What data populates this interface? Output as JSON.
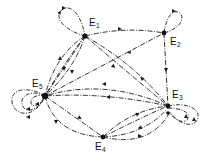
{
  "diagram": {
    "type": "directed-state-transition-graph",
    "nodes": [
      {
        "id": "E1",
        "letter": "E",
        "sub": "1",
        "x": 85,
        "y": 36,
        "lx": 89,
        "ly": 26
      },
      {
        "id": "E2",
        "letter": "E",
        "sub": "2",
        "x": 164,
        "y": 33,
        "lx": 170,
        "ly": 45
      },
      {
        "id": "E3",
        "letter": "E",
        "sub": "3",
        "x": 168,
        "y": 106,
        "lx": 172,
        "ly": 98
      },
      {
        "id": "E4",
        "letter": "E",
        "sub": "4",
        "x": 103,
        "y": 137,
        "lx": 95,
        "ly": 150
      },
      {
        "id": "E5",
        "letter": "E",
        "sub": "5",
        "x": 45,
        "y": 96,
        "lx": 32,
        "ly": 87
      }
    ],
    "edges": [
      {
        "from": "E1",
        "to": "E2"
      },
      {
        "from": "E5",
        "to": "E2"
      },
      {
        "from": "E2",
        "to": "E3"
      },
      {
        "from": "E1",
        "to": "E3"
      },
      {
        "from": "E3",
        "to": "E1"
      },
      {
        "from": "E1",
        "to": "E5"
      },
      {
        "from": "E5",
        "to": "E1"
      },
      {
        "from": "E3",
        "to": "E5"
      },
      {
        "from": "E5",
        "to": "E4"
      },
      {
        "from": "E4",
        "to": "E5"
      },
      {
        "from": "E4",
        "to": "E3"
      },
      {
        "from": "E3",
        "to": "E4"
      }
    ],
    "self_loops": [
      "E1",
      "E2",
      "E3",
      "E5"
    ],
    "line_style": "dash-dot",
    "color": "#1a1a1a"
  }
}
